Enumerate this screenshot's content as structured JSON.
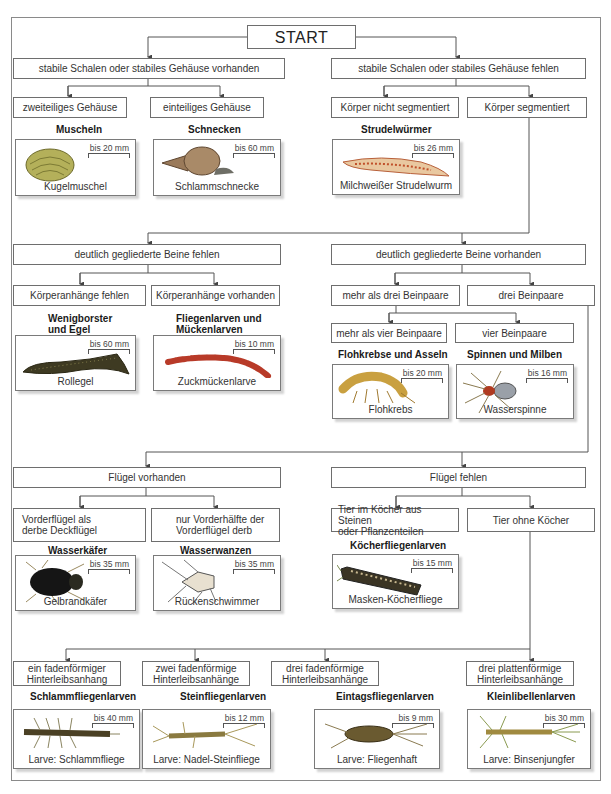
{
  "start": "START",
  "level1": {
    "left": "stabile Schalen oder stabiles Gehäuse vorhanden",
    "right": "stabile Schalen oder stabiles Gehäuse fehlen"
  },
  "level2": {
    "a": "zweiteiliges Gehäuse",
    "b": "einteiliges Gehäuse",
    "c": "Körper nicht segmentiert",
    "d": "Körper segmentiert"
  },
  "groups": {
    "muscheln": "Muscheln",
    "schnecken": "Schnecken",
    "strudel": "Strudelwürmer",
    "wenig1": "Wenigborster",
    "wenig2": "und Egel",
    "fliegen1": "Fliegenlarven und",
    "fliegen2": "Mückenlarven",
    "flohkrebse": "Flohkrebse und Asseln",
    "spinnen": "Spinnen und Milben",
    "kaefer": "Wasserkäfer",
    "wanzen": "Wasserwanzen",
    "koecher": "Köcherfliegenlarven",
    "schlamm": "Schlammfliegenlarven",
    "stein": "Steinfliegenlarven",
    "eintags": "Eintagsfliegenlarven",
    "klein": "Kleinlibellenlarven"
  },
  "level3": {
    "beine_fehlen": "deutlich gegliederte Beine fehlen",
    "beine_vorhanden": "deutlich gegliederte Beine vorhanden"
  },
  "level4": {
    "anh_fehlen": "Körperanhänge fehlen",
    "anh_vorh": "Körperanhänge vorhanden",
    "mehr_drei": "mehr als drei Beinpaare",
    "drei": "drei Beinpaare",
    "mehr_vier": "mehr als vier Beinpaare",
    "vier": "vier Beinpaare"
  },
  "level5": {
    "fluegel_vorh": "Flügel vorhanden",
    "fluegel_fehlen": "Flügel fehlen",
    "vorder1": "Vorderflügel als",
    "vorder2": "derbe Deckflügel",
    "nur1": "nur Vorderhälfte der",
    "nur2": "Vorderflügel derb",
    "tier1": "Tier im Köcher aus Steinen",
    "tier2": "oder Pflanzenteilen",
    "ohne": "Tier ohne Köcher"
  },
  "level6": {
    "ein1": "ein fadenförmiger",
    "ein2": "Hinterleibsanhang",
    "zwei1": "zwei fadenförmige",
    "zwei2": "Hinterleibsanhänge",
    "dreif1": "drei fadenförmige",
    "dreif2": "Hinterleibsanhänge",
    "dreip1": "drei plattenförmige",
    "dreip2": "Hinterleibsanhänge"
  },
  "cards": {
    "kugelmuschel": {
      "name": "Kugelmuschel",
      "size": "bis 20 mm"
    },
    "schlammschnecke": {
      "name": "Schlammschnecke",
      "size": "bis 60 mm"
    },
    "strudelwurm": {
      "name": "Milchweißer Strudelwurm",
      "size": "bis 26 mm"
    },
    "rollegel": {
      "name": "Rollegel",
      "size": "bis 60 mm"
    },
    "zuckmuecke": {
      "name": "Zuckmückenlarve",
      "size": "bis 10 mm"
    },
    "flohkrebs": {
      "name": "Flohkrebs",
      "size": "bis 20 mm"
    },
    "wasserspinne": {
      "name": "Wasserspinne",
      "size": "bis 16 mm"
    },
    "gelbrand": {
      "name": "Gelbrandkäfer",
      "size": "bis 35 mm"
    },
    "rueckenschw": {
      "name": "Rückenschwimmer",
      "size": "bis 35 mm"
    },
    "maskenkoecher": {
      "name": "Masken-Köcherfliege",
      "size": "bis 15 mm"
    },
    "schlammfliege": {
      "name": "Larve: Schlammfliege",
      "size": "bis 40 mm"
    },
    "steinfliege": {
      "name": "Larve: Nadel-Steinfliege",
      "size": "bis 12 mm"
    },
    "fliegenhaft": {
      "name": "Larve: Fliegenhaft",
      "size": "bis 9 mm"
    },
    "binsenjungfer": {
      "name": "Larve: Binsenjungfer",
      "size": "bis 30 mm"
    }
  }
}
